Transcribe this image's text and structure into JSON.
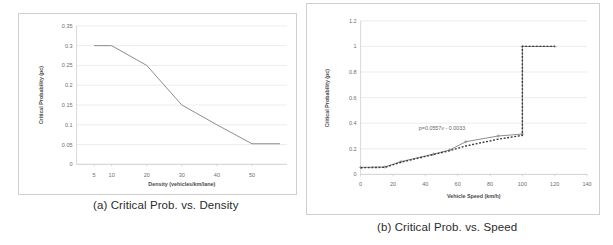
{
  "figure": {
    "caption_a": "(a)  Critical Prob. vs. Density",
    "caption_b": "(b) Critical Prob. vs.  Speed"
  },
  "chart_data": [
    {
      "id": "panel-a",
      "type": "line",
      "title": "",
      "xlabel": "Density (vehicles/km/lane)",
      "ylabel": "Critical Probability (pc)",
      "xlim": [
        0,
        60
      ],
      "ylim": [
        0,
        0.35
      ],
      "xticks": [
        5,
        10,
        20,
        30,
        40,
        50
      ],
      "xtick_labels": [
        "5",
        "10",
        "20",
        "30",
        "40",
        "50"
      ],
      "yticks": [
        0,
        0.05,
        0.1,
        0.15,
        0.2,
        0.25,
        0.3,
        0.35
      ],
      "ytick_labels": [
        "0",
        "0.05",
        "0.1",
        "0.15",
        "0.2",
        "0.25",
        "0.3",
        "0.35"
      ],
      "grid": "horizontal",
      "legend": "none",
      "series": [
        {
          "name": "critical probability",
          "style": "solid",
          "color": "#8c8c8c",
          "x": [
            5,
            10,
            20,
            30,
            40,
            50,
            58
          ],
          "y": [
            0.3,
            0.3,
            0.25,
            0.15,
            0.1,
            0.052,
            0.052
          ]
        }
      ]
    },
    {
      "id": "panel-b",
      "type": "line",
      "title": "",
      "xlabel": "Vehicle Speed (km/h)",
      "ylabel": "Critical Probability (pc)",
      "xlim": [
        0,
        140
      ],
      "ylim": [
        0,
        1.2
      ],
      "xticks": [
        0,
        20,
        40,
        60,
        80,
        100,
        120,
        140
      ],
      "xtick_labels": [
        "0",
        "20",
        "40",
        "60",
        "80",
        "100",
        "120",
        "140"
      ],
      "yticks": [
        0,
        0.2,
        0.4,
        0.6,
        0.8,
        1,
        1.2
      ],
      "ytick_labels": [
        "0",
        "0.2",
        "0.4",
        "0.6",
        "0.8",
        "1",
        "1.2"
      ],
      "grid": "horizontal",
      "legend": "none",
      "annotations": [
        {
          "text": "p=0.0557v - 0.0033",
          "x": 36,
          "y": 0.345
        }
      ],
      "series": [
        {
          "name": "observed",
          "style": "solid-markers",
          "color": "#8c8c8c",
          "x": [
            0,
            15,
            25,
            45,
            55,
            65,
            85,
            100,
            100,
            120
          ],
          "y": [
            0.055,
            0.058,
            0.1,
            0.158,
            0.19,
            0.255,
            0.3,
            0.315,
            1.0,
            1.0
          ]
        },
        {
          "name": "fitted trend",
          "style": "dashed",
          "color": "#3d3d3d",
          "x": [
            0,
            15,
            25,
            45,
            55,
            65,
            85,
            100,
            100,
            120
          ],
          "y": [
            0.052,
            0.055,
            0.095,
            0.155,
            0.185,
            0.222,
            0.275,
            0.305,
            1.0,
            1.0
          ]
        }
      ]
    }
  ]
}
